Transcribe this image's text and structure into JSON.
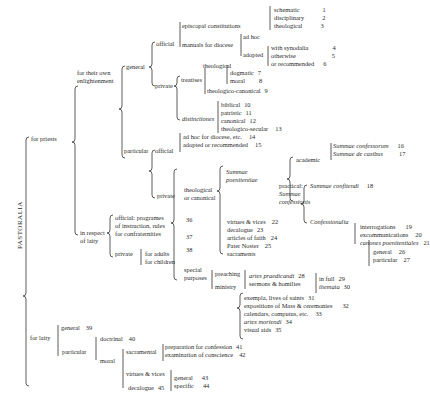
{
  "title": "PASTORALIA",
  "nodes": {
    "for_priests": "for priests",
    "for_own_1": "for their own",
    "for_own_2": "enlightenment",
    "general": "general",
    "official": "official",
    "episcopal": "episcopal constitutions",
    "schematic": {
      "label": "schematic",
      "num": "1"
    },
    "disciplinary": {
      "label": "disciplinary",
      "num": "2"
    },
    "theological_a": {
      "label": "theological",
      "num": "3"
    },
    "manuals": "manuals for diocese",
    "ad_hoc": "ad hoc",
    "adopted": "adopted",
    "with_synodalia": {
      "label": "with synodalia",
      "num": "4"
    },
    "otherwise": {
      "label": "otherwise",
      "num": "5"
    },
    "or_recommended": {
      "label": "or recommended",
      "num": "6"
    },
    "private": "private",
    "treatises": "treatises",
    "theological_b": "theological",
    "dogmatic": {
      "label": "dogmatic",
      "num": "7"
    },
    "moral_a": {
      "label": "moral",
      "num": "8"
    },
    "theologico_canonical": {
      "label": "theologico-canonical",
      "num": "9"
    },
    "distinctiones": "distinctiones",
    "biblical": {
      "label": "biblical",
      "num": "10"
    },
    "patristic": {
      "label": "patristic",
      "num": "11"
    },
    "canonical": {
      "label": "canonical",
      "num": "12"
    },
    "theologico_secular": {
      "label": "theologico-secular",
      "num": "13"
    },
    "particular": "particular",
    "official_p": "official",
    "ad_hoc_diocese": {
      "label": "ad hoc for diocese, etc.",
      "num": "14"
    },
    "adopted_rec": {
      "label": "adopted or recommended",
      "num": "15"
    },
    "private_p": "private",
    "theol_canon_1": "theological",
    "theol_canon_2": "or canonical",
    "summae_poen_1": "Summae",
    "summae_poen_2": "poenitentiae",
    "academic": "academic",
    "summae_confessorum": {
      "label": "Summae confessorum",
      "num": "16"
    },
    "summae_de_casibus": {
      "label": "Summae de casibus",
      "num": "17"
    },
    "practical_1": "practical:",
    "practical_2": "Summae",
    "practical_3": "confessionis",
    "summae_confitendi": {
      "label": "Summae confitendi",
      "num": "18"
    },
    "confessionalia": "Confessionalia",
    "interrogations": {
      "label": "interrogations",
      "num": "19"
    },
    "excommunications": {
      "label": "excommunications",
      "num": "20"
    },
    "canones": {
      "label": "canones poenitentiales",
      "num": "21"
    },
    "virtues_vices_a": {
      "label": "virtues & vices",
      "num": "22"
    },
    "decalogue_a": {
      "label": "decalogue",
      "num": "23"
    },
    "articles": {
      "label": "articles of faith",
      "num": "24"
    },
    "pater": {
      "label": "Pater Noster",
      "num": "25"
    },
    "sacraments": "sacraments",
    "general_s": {
      "label": "general",
      "num": "26"
    },
    "particular_s": {
      "label": "particular",
      "num": "27"
    },
    "in_respect_1": "in respect",
    "in_respect_2": "of laity",
    "official_l1": "official: programes",
    "official_l2": "of instruction, rules",
    "official_l3": "for confraternities",
    "num36": "36",
    "num37": "37",
    "num38": "38",
    "private_l": "private",
    "for_adults": "for adults",
    "for_children": "for children",
    "special_1": "special",
    "special_2": "purposes",
    "preaching": "preaching",
    "artes_praedicandi": {
      "label": "artes praedicandi",
      "num": "28"
    },
    "sermons": "sermons & homilies",
    "in_full": {
      "label": "in full",
      "num": "29"
    },
    "themata": {
      "label": "themata",
      "num": "30"
    },
    "ministry": "ministry",
    "exempla": {
      "label": "exempla, lives of saints",
      "num": "31"
    },
    "expositions": {
      "label": "expositions of Mass & ceremonies",
      "num": "32"
    },
    "calendars": {
      "label": "calendars, computus, etc.",
      "num": "33"
    },
    "artes_moriendi": {
      "label": "artes moriendi",
      "num": "34"
    },
    "visual_aids": {
      "label": "visual aids",
      "num": "35"
    },
    "for_laity": "for laity",
    "general_l": {
      "label": "general",
      "num": "39"
    },
    "particular_l": "particular",
    "doctrinal": {
      "label": "doctrinal",
      "num": "40"
    },
    "moral_l": "moral",
    "sacramental": "sacramental",
    "preparation": {
      "label": "preparation for confession",
      "num": "41"
    },
    "examination": {
      "label": "examination of conscience",
      "num": "42"
    },
    "virtues_vices_l": "virtues & vices",
    "decalogue_l": {
      "label": "decalogue",
      "num": "45"
    },
    "general_v": {
      "label": "general",
      "num": "43"
    },
    "specific_v": {
      "label": "specific",
      "num": "44"
    }
  }
}
